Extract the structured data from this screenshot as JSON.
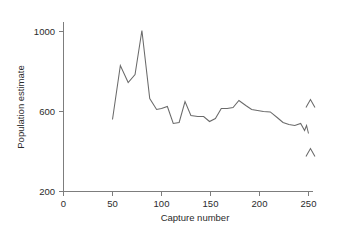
{
  "chart_data": {
    "type": "line",
    "title": "",
    "xlabel": "Capture number",
    "ylabel": "Population estimate",
    "xlim": [
      0,
      258
    ],
    "ylim": [
      200,
      1040
    ],
    "xticks": [
      0,
      50,
      100,
      150,
      200,
      250
    ],
    "yticks": [
      200,
      600,
      1000
    ],
    "xticklabels": [
      "0",
      "50",
      "100",
      "150",
      "200",
      "250"
    ],
    "yticklabels": [
      "200",
      "600",
      "1000"
    ],
    "grid": false,
    "legend": false,
    "series": [
      {
        "name": "Population estimate",
        "x": [
          50,
          58,
          66,
          73,
          80,
          88,
          95,
          100,
          106,
          112,
          118,
          124,
          130,
          137,
          143,
          149,
          155,
          161,
          167,
          173,
          179,
          186,
          192,
          198,
          204,
          211,
          218,
          224,
          230,
          236,
          242,
          246,
          248,
          250
        ],
        "y": [
          560,
          830,
          745,
          785,
          1005,
          665,
          610,
          615,
          625,
          540,
          545,
          650,
          580,
          575,
          575,
          550,
          565,
          615,
          615,
          620,
          655,
          630,
          610,
          605,
          600,
          598,
          570,
          545,
          535,
          530,
          540,
          505,
          530,
          490
        ]
      }
    ],
    "annotations": [
      {
        "name": "upper-interval-caret",
        "shape": "caret-up",
        "x": 252,
        "y": 640
      },
      {
        "name": "lower-interval-caret",
        "shape": "caret-up",
        "x": 252,
        "y": 395
      }
    ]
  },
  "axes": {
    "y_title": "Population estimate",
    "x_title": "Capture number",
    "y_tick_labels": [
      "1000",
      "600",
      "200"
    ],
    "x_tick_labels": [
      "0",
      "50",
      "100",
      "150",
      "200",
      "250"
    ]
  },
  "colors": {
    "line": "#6a6a6a",
    "axis": "#7d7d7d",
    "text": "#2b2b2b",
    "background": "#ffffff"
  }
}
